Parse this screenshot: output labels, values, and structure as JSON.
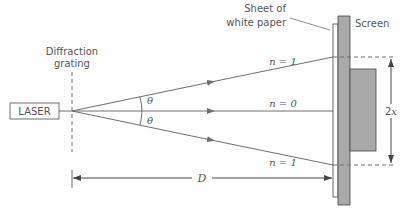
{
  "diagram": {
    "labels": {
      "laser": "LASER",
      "grating_line1": "Diffraction",
      "grating_line2": "grating",
      "paper_line1": "Sheet of",
      "paper_line2": "white paper",
      "screen": "Screen",
      "theta_top": "θ",
      "theta_bottom": "θ",
      "order_top": "n = 1",
      "order_middle": "n = 0",
      "order_bottom": "n = 1",
      "distance": "D",
      "separation": "2x"
    },
    "colors": {
      "line": "#6e6e6e",
      "text": "#555555",
      "screen_fill": "#a9a9a9",
      "paper_fill": "#ffffff",
      "stroke_dark": "#444444"
    }
  }
}
